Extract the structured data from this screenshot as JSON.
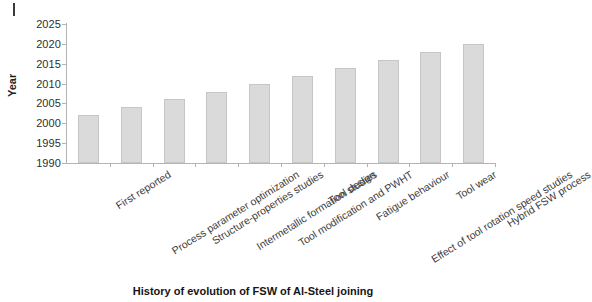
{
  "chart_data": {
    "type": "bar",
    "title": "History of evolution of FSW of Al-Steel joining",
    "xlabel": "History of evolution of FSW of Al-Steel joining",
    "ylabel": "Year",
    "ylim": [
      1990,
      2025
    ],
    "ytick_step": 5,
    "grid": false,
    "legend": null,
    "bar_color": "#dadada",
    "bar_border_color": "#c6c6c6",
    "yticks": [
      "1990",
      "1995",
      "2000",
      "2005",
      "2010",
      "2015",
      "2020",
      "2025"
    ],
    "ytick_values": [
      1990,
      1995,
      2000,
      2005,
      2010,
      2015,
      2020,
      2025
    ],
    "categories": [
      "First reported",
      "Process parameter optimization",
      "Structure-properties studies",
      "Intermetallic formation studies",
      "Tool modification and PWHT",
      "Tool design",
      "Fatigue behaviour",
      "Effect of tool rotation speed studies",
      "Tool wear",
      "Hybrid FSW process"
    ],
    "values": [
      2002,
      2004,
      2006,
      2008,
      2010,
      2012,
      2014,
      2016,
      2018,
      2020
    ]
  }
}
